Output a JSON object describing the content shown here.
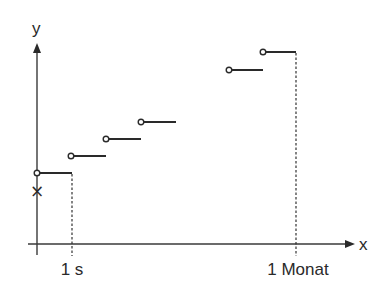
{
  "diagram": {
    "type": "step-function",
    "axes": {
      "y_label": "y",
      "x_label": "x",
      "origin": [
        37,
        244
      ],
      "y_axis": {
        "x": 37,
        "y_top": 45,
        "y_bottom": 255
      },
      "x_axis": {
        "y": 244,
        "x_left": 28,
        "x_right": 352
      }
    },
    "tick_labels": [
      {
        "text": "1 s",
        "x": 72
      },
      {
        "text": "1 Monat",
        "x": 296
      }
    ],
    "marker": {
      "symbol": "×",
      "x": 37,
      "y": 190
    },
    "steps": [
      {
        "x0": 37,
        "x1": 72,
        "y": 173
      },
      {
        "x0": 71,
        "x1": 106,
        "y": 156
      },
      {
        "x0": 106,
        "x1": 141,
        "y": 139
      },
      {
        "x0": 141,
        "x1": 176,
        "y": 122
      },
      {
        "x0": 229,
        "x1": 263,
        "y": 70
      },
      {
        "x0": 263,
        "x1": 296,
        "y": 52
      }
    ],
    "dashed_guides": [
      {
        "x": 72,
        "y_top": 173,
        "y_bottom": 256
      },
      {
        "x": 296,
        "y_top": 52,
        "y_bottom": 256
      }
    ],
    "colors": {
      "stroke": "#2a2a2a",
      "background": "#ffffff"
    }
  }
}
